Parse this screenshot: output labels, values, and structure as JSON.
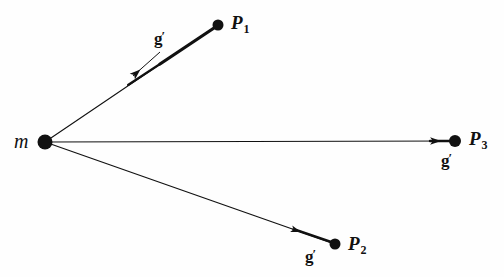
{
  "figure": {
    "background_color": "#fefefe",
    "ink_color": "#111111",
    "width": 504,
    "height": 277
  },
  "mass": {
    "label": "m",
    "x": 45,
    "y": 142,
    "dot_radius": 7.5
  },
  "points": [
    {
      "id": "P1",
      "label": "P",
      "subscript": "1",
      "x": 218,
      "y": 25,
      "dot_radius": 5.5,
      "vector_label": "g",
      "vector_prime": "′",
      "arrow_tip_x": 133,
      "arrow_tip_y": 76,
      "stroke_start": 3.2,
      "stroke_end": 1.0
    },
    {
      "id": "P2",
      "label": "P",
      "subscript": "2",
      "x": 335,
      "y": 244,
      "dot_radius": 5.5,
      "vector_label": "g",
      "vector_prime": "′",
      "arrow_tip_x": 292,
      "arrow_tip_y": 233,
      "stroke_start": 2.2,
      "stroke_end": 1.0
    },
    {
      "id": "P3",
      "label": "P",
      "subscript": "3",
      "x": 455,
      "y": 141,
      "dot_radius": 6.0,
      "vector_label": "g",
      "vector_prime": "′",
      "arrow_tip_x": 431,
      "arrow_tip_y": 141,
      "stroke_start": 1.2,
      "stroke_end": 1.0
    }
  ]
}
